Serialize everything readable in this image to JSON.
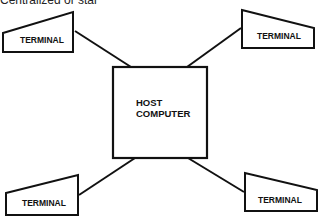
{
  "caption": "Centralized or star",
  "diagram": {
    "type": "star-network",
    "center": {
      "id": "host",
      "label_lines": [
        "HOST",
        "COMPUTER"
      ]
    },
    "nodes": [
      {
        "id": "terminal-top-left",
        "label": "TERMINAL"
      },
      {
        "id": "terminal-top-right",
        "label": "TERMINAL"
      },
      {
        "id": "terminal-bottom-left",
        "label": "TERMINAL"
      },
      {
        "id": "terminal-bottom-right",
        "label": "TERMINAL"
      }
    ],
    "edges": [
      {
        "from": "host",
        "to": "terminal-top-left"
      },
      {
        "from": "host",
        "to": "terminal-top-right"
      },
      {
        "from": "host",
        "to": "terminal-bottom-left"
      },
      {
        "from": "host",
        "to": "terminal-bottom-right"
      }
    ],
    "colors": {
      "stroke": "#111111",
      "background": "#ffffff"
    }
  }
}
